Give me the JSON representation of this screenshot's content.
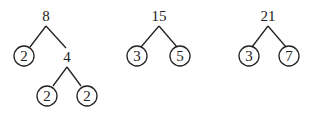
{
  "trees": [
    {
      "root": "8",
      "children": [
        {
          "value": "2",
          "circled": true
        },
        {
          "value": "4",
          "circled": false,
          "children": [
            {
              "value": "2",
              "circled": true
            },
            {
              "value": "2",
              "circled": true
            }
          ]
        }
      ]
    },
    {
      "root": "15",
      "children": [
        {
          "value": "3",
          "circled": true
        },
        {
          "value": "5",
          "circled": true
        }
      ]
    },
    {
      "root": "21",
      "children": [
        {
          "value": "3",
          "circled": true
        },
        {
          "value": "7",
          "circled": true
        }
      ]
    }
  ]
}
